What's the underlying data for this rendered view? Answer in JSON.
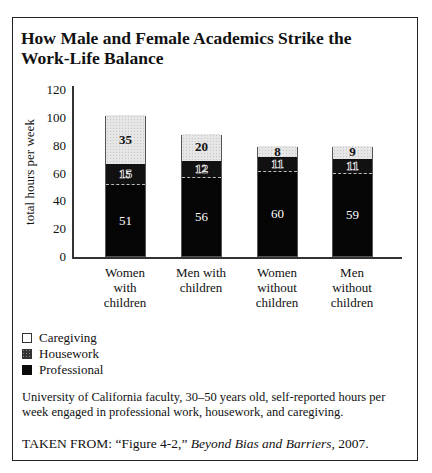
{
  "title": "How Male and Female Academics Strike the Work-Life Balance",
  "title_lines": [
    "How Male and Female Academics Strike the",
    "Work-Life Balance"
  ],
  "ylabel": "total hours per week",
  "yticks": [
    "120",
    "100",
    "80",
    "60",
    "40",
    "20",
    "0"
  ],
  "categories": [
    {
      "lines": [
        "Women",
        "with",
        "children"
      ]
    },
    {
      "lines": [
        "Men with",
        "children"
      ]
    },
    {
      "lines": [
        "Women",
        "without",
        "children"
      ]
    },
    {
      "lines": [
        "Men",
        "without",
        "children"
      ]
    }
  ],
  "legend": [
    "Caregiving",
    "Housework",
    "Professional"
  ],
  "note": "University of California faculty, 30–50 years old, self-reported hours per week engaged in professional work, housework, and caregiving.",
  "source": {
    "prefix": "TAKEN FROM: “Figure 4-2,” ",
    "book": "Beyond Bias and Barriers,",
    "suffix": " 2007."
  },
  "chart_data": {
    "type": "bar",
    "stacked": true,
    "title": "How Male and Female Academics Strike the Work-Life Balance",
    "xlabel": "",
    "ylabel": "total hours per week",
    "ylim": [
      0,
      120
    ],
    "yticks": [
      0,
      20,
      40,
      60,
      80,
      100,
      120
    ],
    "grid": false,
    "legend_position": "bottom-left",
    "categories": [
      "Women with children",
      "Men with children",
      "Women without children",
      "Men without children"
    ],
    "series": [
      {
        "name": "Professional",
        "values": [
          51,
          56,
          60,
          59
        ],
        "color": "#050505"
      },
      {
        "name": "Housework",
        "values": [
          15,
          12,
          11,
          11
        ],
        "color": "#111111"
      },
      {
        "name": "Caregiving",
        "values": [
          35,
          20,
          8,
          9
        ],
        "color": "#e6e6e6"
      }
    ],
    "annotations": "University of California faculty, 30–50 years old, self-reported hours per week engaged in professional work, housework, and caregiving. TAKEN FROM: “Figure 4-2,” Beyond Bias and Barriers, 2007."
  }
}
